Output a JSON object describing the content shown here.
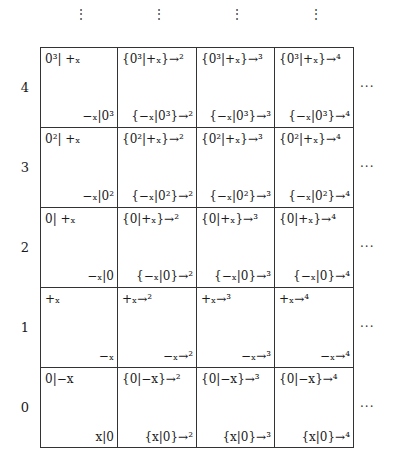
{
  "top_ellipsis": [
    "⋮",
    "⋮",
    "⋮",
    "⋮"
  ],
  "right_ellipsis": "···",
  "row_labels": [
    "4",
    "3",
    "2",
    "1",
    "0"
  ],
  "rows": [
    {
      "label": "4",
      "cells": [
        {
          "top_left": "0³| +ₓ",
          "bottom_right": "−ₓ|0³"
        },
        {
          "top_left": "{0³|+ₓ}→²",
          "bottom_right": "{−ₓ|0³}→²"
        },
        {
          "top_left": "{0³|+ₓ}→³",
          "bottom_right": "{−ₓ|0³}→³"
        },
        {
          "top_left": "{0³|+ₓ}→⁴",
          "bottom_right": "{−ₓ|0³}→⁴"
        }
      ]
    },
    {
      "label": "3",
      "cells": [
        {
          "top_left": "0²| +ₓ",
          "bottom_right": "−ₓ|0²"
        },
        {
          "top_left": "{0²|+ₓ}→²",
          "bottom_right": "{−ₓ|0²}→²"
        },
        {
          "top_left": "{0²|+ₓ}→³",
          "bottom_right": "{−ₓ|0²}→³"
        },
        {
          "top_left": "{0²|+ₓ}→⁴",
          "bottom_right": "{−ₓ|0²}→⁴"
        }
      ]
    },
    {
      "label": "2",
      "cells": [
        {
          "top_left": "0| +ₓ",
          "bottom_right": "−ₓ|0"
        },
        {
          "top_left": "{0|+ₓ}→²",
          "bottom_right": "{−ₓ|0}→²"
        },
        {
          "top_left": "{0|+ₓ}→³",
          "bottom_right": "{−ₓ|0}→³"
        },
        {
          "top_left": "{0|+ₓ}→⁴",
          "bottom_right": "{−ₓ|0}→⁴"
        }
      ]
    },
    {
      "label": "1",
      "cells": [
        {
          "top_left": "+ₓ",
          "bottom_right": "−ₓ"
        },
        {
          "top_left": "+ₓ→²",
          "bottom_right": "−ₓ→²"
        },
        {
          "top_left": "+ₓ→³",
          "bottom_right": "−ₓ→³"
        },
        {
          "top_left": "+ₓ→⁴",
          "bottom_right": "−ₓ→⁴"
        }
      ]
    },
    {
      "label": "0",
      "cells": [
        {
          "top_left": "0|−x",
          "bottom_right": "x|0"
        },
        {
          "top_left": "{0|−x}→²",
          "bottom_right": "{x|0}→²"
        },
        {
          "top_left": "{0|−x}→³",
          "bottom_right": "{x|0}→³"
        },
        {
          "top_left": "{0|−x}→⁴",
          "bottom_right": "{x|0}→⁴"
        }
      ]
    }
  ]
}
